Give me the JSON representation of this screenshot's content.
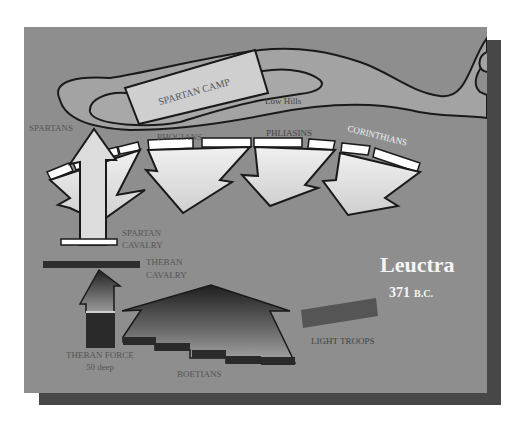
{
  "title": {
    "name": "Leuctra",
    "date_prefix": "371",
    "date_era": "B.C."
  },
  "colors": {
    "background": "#8e8e8e",
    "shadow": "#474747",
    "hills_fill": "#a2a2a2",
    "camp_fill": "#cfcfcf",
    "unit_fill": "#e2e2e2",
    "rank_fill": "#ffffff",
    "dark_unit": "#2e2e2e",
    "outline": "#1a1a1a",
    "label_dark": "#4a4a4a",
    "label_light": "#f2f2f2",
    "light_troops": "#555555"
  },
  "terrain": {
    "camp_label": "SPARTAN CAMP",
    "hills_label": "Low Hills"
  },
  "spartan_side": {
    "units": [
      {
        "label": "SPARTANS"
      },
      {
        "label": "PHOCIANS"
      },
      {
        "label": "PHLIASINS"
      },
      {
        "label": "CORINTHIANS"
      }
    ],
    "cavalry_label_line1": "SPARTAN",
    "cavalry_label_line2": "CAVALRY"
  },
  "theban_side": {
    "cavalry_label_line1": "THEBAN",
    "cavalry_label_line2": "CAVALRY",
    "force_label_line1": "THEBAN FORCE",
    "force_label_line2": "50 deep",
    "boetians_label": "BOETIANS",
    "light_troops_label": "LIGHT TROOPS"
  }
}
